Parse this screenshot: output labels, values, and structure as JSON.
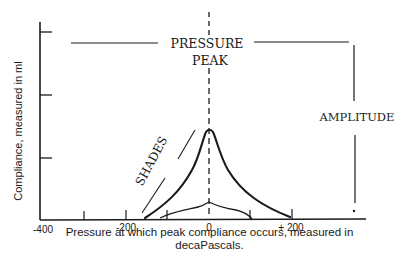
{
  "diagram": {
    "labels": {
      "pressure_peak_line1": "PRESSURE",
      "pressure_peak_line2": "PEAK",
      "amplitude": "AMPLITUDE",
      "shades": "SHADES",
      "y_axis": "Compliance, measured in ml",
      "x_axis_line1": "Pressure at which peak compliance occurs, measured in",
      "x_axis_line2": "decaPascals."
    },
    "x_ticks": [
      {
        "label": "-400",
        "value": -400
      },
      {
        "label": "",
        "value": -300
      },
      {
        "label": "-200",
        "value": -200
      },
      {
        "label": "",
        "value": -100
      },
      {
        "label": "0",
        "value": 0
      },
      {
        "label": "",
        "value": 100
      },
      {
        "label": "+ 200",
        "value": 200
      }
    ],
    "colors": {
      "ink": "#1a1a1a",
      "background": "#ffffff"
    }
  }
}
